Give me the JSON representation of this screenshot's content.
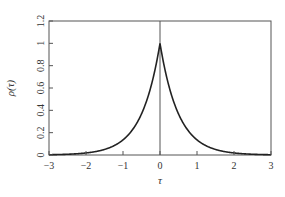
{
  "chart_data": {
    "type": "line",
    "title": "",
    "xlabel": "τ",
    "ylabel": "ρ(τ)",
    "xlim": [
      -3,
      3
    ],
    "ylim": [
      0,
      1.2
    ],
    "xticks": [
      -3,
      -2,
      -1,
      0,
      1,
      2,
      3
    ],
    "xtick_labels": [
      "−3",
      "−2",
      "−1",
      "0",
      "1",
      "2",
      "3"
    ],
    "yticks": [
      0,
      0.2,
      0.4,
      0.6,
      0.8,
      1,
      1.2
    ],
    "ytick_labels": [
      "0",
      "0.2",
      "0.4",
      "0.6",
      "0.8",
      "1",
      "1.2"
    ],
    "grid": false,
    "legend": null,
    "annotations": [
      "vertical line at τ = 0"
    ],
    "series": [
      {
        "name": "ρ(τ) = exp(−2|τ|)",
        "x": [
          -3,
          -2.5,
          -2,
          -1.5,
          -1,
          -0.75,
          -0.5,
          -0.25,
          0,
          0.25,
          0.5,
          0.75,
          1,
          1.5,
          2,
          2.5,
          3
        ],
        "y": [
          0.002,
          0.007,
          0.018,
          0.05,
          0.135,
          0.223,
          0.368,
          0.607,
          1.0,
          0.607,
          0.368,
          0.223,
          0.135,
          0.05,
          0.018,
          0.007,
          0.002
        ]
      }
    ],
    "color": "#222222"
  }
}
